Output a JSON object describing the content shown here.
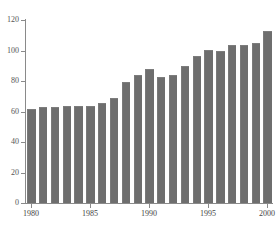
{
  "caption": {
    "text": "",
    "visible": false
  },
  "chart_data": {
    "type": "bar",
    "title": "",
    "subtitle": "",
    "xlabel": "",
    "ylabel": "",
    "ylim": [
      0,
      120
    ],
    "yticks": [
      0,
      20,
      40,
      60,
      80,
      100,
      120
    ],
    "ytick_labels": [
      "0",
      "20",
      "40",
      "60",
      "80",
      "100",
      "120"
    ],
    "xticks": [
      1980,
      1985,
      1990,
      1995,
      2000
    ],
    "xtick_labels": [
      "1980",
      "1985",
      "1990",
      "1995",
      "2000"
    ],
    "grid": false,
    "legend": null,
    "bar_color": "#6e6e6e",
    "axis_color": "#8a8a8a",
    "background": "#ffffff",
    "categories": [
      "1980",
      "1981",
      "1982",
      "1983",
      "1984",
      "1985",
      "1986",
      "1987",
      "1988",
      "1989",
      "1990",
      "1991",
      "1992",
      "1993",
      "1994",
      "1995",
      "1996",
      "1997",
      "1998",
      "1999",
      "2000"
    ],
    "values": [
      61,
      62,
      62,
      63,
      63,
      63,
      65,
      68,
      79,
      83,
      87,
      82,
      83,
      89,
      96,
      100,
      99,
      103,
      103,
      104,
      112
    ],
    "series": [
      {
        "name": "",
        "values": [
          61,
          62,
          62,
          63,
          63,
          63,
          65,
          68,
          79,
          83,
          87,
          82,
          83,
          89,
          96,
          100,
          99,
          103,
          103,
          104,
          112
        ]
      }
    ]
  }
}
